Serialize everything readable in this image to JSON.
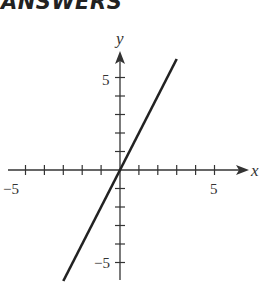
{
  "header": {
    "title": "ANSWERS"
  },
  "chart_data": {
    "type": "line",
    "title": "",
    "xlabel": "x",
    "ylabel": "y",
    "xlim": [
      -6,
      7
    ],
    "ylim": [
      -6,
      6.5
    ],
    "x_ticks": [
      -5,
      -4,
      -3,
      -2,
      -1,
      1,
      2,
      3,
      4,
      5
    ],
    "y_ticks": [
      -5,
      -4,
      -3,
      -2,
      -1,
      1,
      2,
      3,
      4,
      5
    ],
    "x_tick_labels": {
      "-5": "−5",
      "5": "5"
    },
    "y_tick_labels": {
      "-5": "−5",
      "5": "5"
    },
    "grid": false,
    "series": [
      {
        "name": "y = 2x",
        "x": [
          -3,
          3
        ],
        "y": [
          -6,
          6
        ],
        "color": "#222222"
      }
    ]
  },
  "labels": {
    "x_axis": "x",
    "y_axis": "y",
    "x_neg5": "−5",
    "x_pos5": "5",
    "y_pos5": "5",
    "y_neg5": "−5"
  }
}
